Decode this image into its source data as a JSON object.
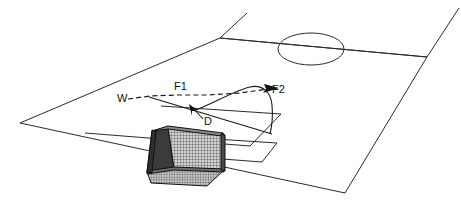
{
  "figure": {
    "background_color": "#ffffff",
    "line_color": "#2b2b2b",
    "ink_color": "#111111"
  },
  "labels": {
    "wind": "W",
    "force_one": "F1",
    "force_two": "F2",
    "drag": "D"
  },
  "annotations": [
    {
      "name": "wind-label",
      "text": "W",
      "x": 118,
      "y": 101,
      "description": "wind direction label at left end of dashed trajectory"
    },
    {
      "name": "force-one-label",
      "text": "F1",
      "x": 176,
      "y": 91,
      "description": "first force label above the dashed trajectory"
    },
    {
      "name": "force-two-label",
      "text": "F2",
      "x": 272,
      "y": 93,
      "description": "second force label at arrowhead of dashed trajectory"
    },
    {
      "name": "drag-label",
      "text": "D",
      "x": 205,
      "y": 124,
      "description": "drag label at tail of leader arrow"
    }
  ],
  "pitch": {
    "outline_points": "220,38 427,57 345,193 20,123",
    "halfway_line": "220,38 427,57",
    "center_circle": {
      "cx": 311,
      "cy": 49,
      "rx": 33,
      "ry": 16
    },
    "penalty_area": "85,133 250,146 281,114 161,106",
    "goal_area": "196,157 262,162 277,143 215,139"
  },
  "vectors": {
    "trajectory_dashed": "M128,99 L150,96 L176,95 L206,95 L240,93 L268,89",
    "arrow_f2": {
      "tip_x": 278,
      "tip_y": 88
    },
    "curve_solid": "M196,110 C214,104 236,92 250,88 C262,84 270,92 272,104 C273,114 272,124 270,133",
    "ground_line": "M150,96 L272,133",
    "drag_arrow": {
      "tip_x": 191,
      "tip_y": 106,
      "tail_x": 204,
      "tail_y": 119
    }
  },
  "goal": {
    "description": "3D soccer goal with mesh net shown in perspective",
    "net_fill": "#c9c9c9",
    "frame_color": "#111111",
    "crossbar_color": "#8a8a8a",
    "post_shadow_color": "#3b3b3b"
  }
}
